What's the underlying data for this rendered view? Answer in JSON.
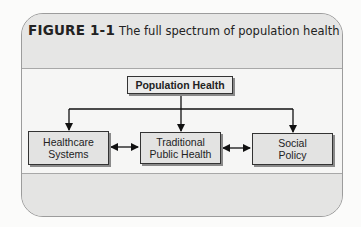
{
  "figure": {
    "label": "FIGURE 1-1",
    "caption": "The full spectrum of population health"
  },
  "diagram": {
    "root": "Population Health",
    "nodes": [
      {
        "line1": "Healthcare",
        "line2": "Systems"
      },
      {
        "line1": "Traditional",
        "line2": "Public Health"
      },
      {
        "line1": "Social",
        "line2": "Policy"
      }
    ],
    "edges": [
      {
        "from": "Population Health",
        "to": "Healthcare Systems",
        "type": "directed"
      },
      {
        "from": "Population Health",
        "to": "Traditional Public Health",
        "type": "directed"
      },
      {
        "from": "Population Health",
        "to": "Social Policy",
        "type": "directed"
      },
      {
        "from": "Healthcare Systems",
        "to": "Traditional Public Health",
        "type": "bidirectional"
      },
      {
        "from": "Traditional Public Health",
        "to": "Social Policy",
        "type": "bidirectional"
      }
    ]
  }
}
